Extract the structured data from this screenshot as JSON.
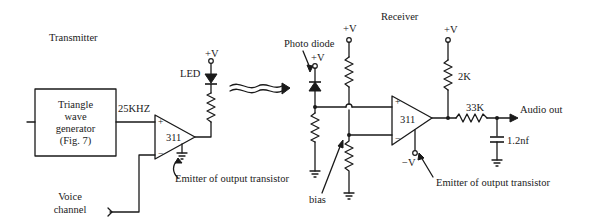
{
  "sections": {
    "transmitter_title": "Transmitter",
    "receiver_title": "Receiver"
  },
  "transmitter": {
    "generator_block": {
      "line1": "Triangle",
      "line2": "wave",
      "line3": "generator",
      "line4": "(Fig. 7)"
    },
    "frequency_label": "25KHZ",
    "comparator_label": "311",
    "comparator_plus": "+",
    "comparator_minus": "−",
    "led_label": "LED",
    "supply_label": "+V",
    "emitter_note": "Emitter of output transistor",
    "voice_label_line1": "Voice",
    "voice_label_line2": "channel"
  },
  "receiver": {
    "photodiode_label": "Photo diode",
    "photodiode_supply": "+V",
    "divider_supply": "+V",
    "bias_label": "bias",
    "comparator_label": "311",
    "comparator_plus": "+",
    "comparator_minus": "−",
    "neg_supply_label": "−V",
    "pullup_supply": "+V",
    "pullup_resistor": "2K",
    "series_resistor": "33K",
    "capacitor": "1.2nf",
    "output_label": "Audio out",
    "emitter_note": "Emitter of output transistor"
  },
  "icons": {
    "led": "led-diode-icon",
    "photodiode": "photodiode-icon",
    "light_waves": "light-transmission-icon",
    "ground": "ground-icon",
    "resistor": "resistor-icon",
    "capacitor": "capacitor-icon",
    "comparator": "op-amp-triangle-icon"
  }
}
